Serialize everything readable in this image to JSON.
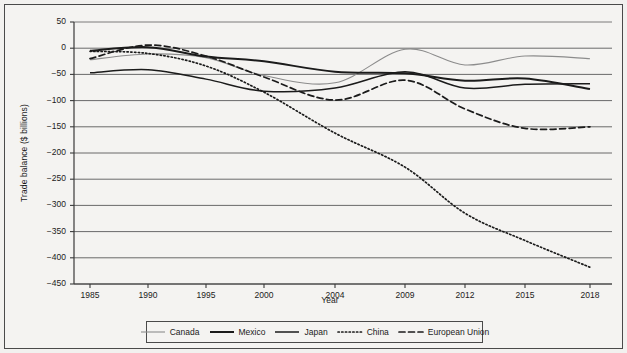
{
  "chart_data": {
    "type": "line",
    "title": "",
    "xlabel": "Year",
    "ylabel": "Trade balance ($ billions)",
    "x": [
      1985,
      1990,
      1995,
      2000,
      2004,
      2009,
      2012,
      2015,
      2018
    ],
    "xtick_labels": [
      "1985",
      "1990",
      "1995",
      "2000",
      "2004",
      "2009",
      "2012",
      "2015",
      "2018"
    ],
    "ytick_labels": [
      "50",
      "0",
      "−50",
      "−100",
      "−150",
      "−200",
      "−250",
      "−300",
      "−350",
      "−400",
      "−450"
    ],
    "ytick_values": [
      50,
      0,
      -50,
      -100,
      -150,
      -200,
      -250,
      -300,
      -350,
      -400,
      -450
    ],
    "ylim": [
      -450,
      50
    ],
    "grid": "horizontal",
    "legend_position": "bottom",
    "series": [
      {
        "name": "Canada",
        "style": "solid-thin-gray",
        "color": "#8c8c8c",
        "values": [
          -22,
          -11,
          -18,
          -52,
          -66,
          -2,
          -32,
          -15,
          -20
        ]
      },
      {
        "name": "Mexico",
        "style": "solid-thick-black",
        "color": "#1b1b1b",
        "values": [
          -5,
          2,
          -16,
          -25,
          -45,
          -48,
          -62,
          -58,
          -78
        ]
      },
      {
        "name": "Japan",
        "style": "solid-medium-black",
        "color": "#1b1b1b",
        "values": [
          -47,
          -41,
          -59,
          -82,
          -76,
          -45,
          -76,
          -69,
          -68
        ]
      },
      {
        "name": "China",
        "style": "dotted-black",
        "color": "#1b1b1b",
        "values": [
          -6,
          -10,
          -34,
          -84,
          -162,
          -227,
          -315,
          -367,
          -418
        ]
      },
      {
        "name": "European Union",
        "style": "dashed-black",
        "color": "#1b1b1b",
        "values": [
          -20,
          6,
          -15,
          -55,
          -99,
          -61,
          -116,
          -153,
          -150
        ]
      }
    ]
  },
  "axes": {
    "ylabel": "Trade balance ($ billions)",
    "xlabel": "Year"
  },
  "legend": {
    "items": [
      {
        "label": "Canada"
      },
      {
        "label": "Mexico"
      },
      {
        "label": "Japan"
      },
      {
        "label": "China"
      },
      {
        "label": "European Union"
      }
    ]
  }
}
